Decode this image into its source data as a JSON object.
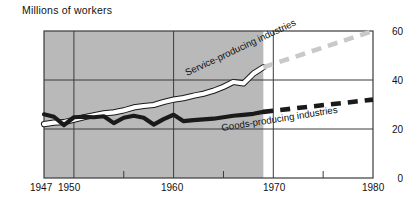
{
  "chart_data": {
    "type": "line",
    "title": "Millions of workers",
    "xlabel": "",
    "ylabel": "Millions of workers",
    "xlim": [
      1947,
      1980
    ],
    "ylim": [
      0,
      60
    ],
    "yticks": [
      0,
      20,
      40,
      60
    ],
    "xticks": [
      1947,
      1950,
      1960,
      1970,
      1980
    ],
    "xminorticks": [
      1955,
      1965,
      1975
    ],
    "grid": true,
    "legend_position": "inline-annotation",
    "shaded_region": {
      "label": "historical",
      "x_start": 1947,
      "x_end": 1969,
      "color": "#b9b9b9"
    },
    "unshaded_region": {
      "label": "projected",
      "x_start": 1969,
      "x_end": 1980,
      "color": "#ffffff"
    },
    "series": [
      {
        "name": "Service-producing industries",
        "color": "#ffffff",
        "outline_color": "#1a1a1a",
        "style_historical": "solid",
        "style_projected": "dashed",
        "projection_color": "#c9c9c9",
        "x": [
          1947,
          1948,
          1949,
          1950,
          1951,
          1952,
          1953,
          1954,
          1955,
          1956,
          1957,
          1958,
          1959,
          1960,
          1961,
          1962,
          1963,
          1964,
          1965,
          1966,
          1967,
          1968,
          1969,
          1980
        ],
        "values": [
          22.0,
          22.6,
          22.8,
          23.8,
          24.8,
          25.6,
          26.4,
          26.8,
          27.6,
          28.8,
          29.4,
          29.8,
          31.0,
          32.0,
          32.6,
          33.6,
          34.4,
          35.6,
          37.2,
          39.2,
          38.6,
          42.6,
          45.2,
          60.0
        ]
      },
      {
        "name": "Goods-producing industries",
        "color": "#1a1a1a",
        "style_historical": "solid",
        "style_projected": "dashed",
        "projection_color": "#1a1a1a",
        "x": [
          1947,
          1948,
          1949,
          1950,
          1951,
          1952,
          1953,
          1954,
          1955,
          1956,
          1957,
          1958,
          1959,
          1960,
          1961,
          1962,
          1963,
          1964,
          1965,
          1966,
          1967,
          1968,
          1969,
          1980
        ],
        "values": [
          26.0,
          25.0,
          21.6,
          24.8,
          25.0,
          24.8,
          25.2,
          22.4,
          24.6,
          25.4,
          24.6,
          21.8,
          24.0,
          25.8,
          23.2,
          23.6,
          23.9,
          24.2,
          24.8,
          25.4,
          25.8,
          26.2,
          27.0,
          32.0
        ]
      }
    ]
  },
  "labels": {
    "service": "Service-producing industries",
    "goods": "Goods-producing industries"
  }
}
